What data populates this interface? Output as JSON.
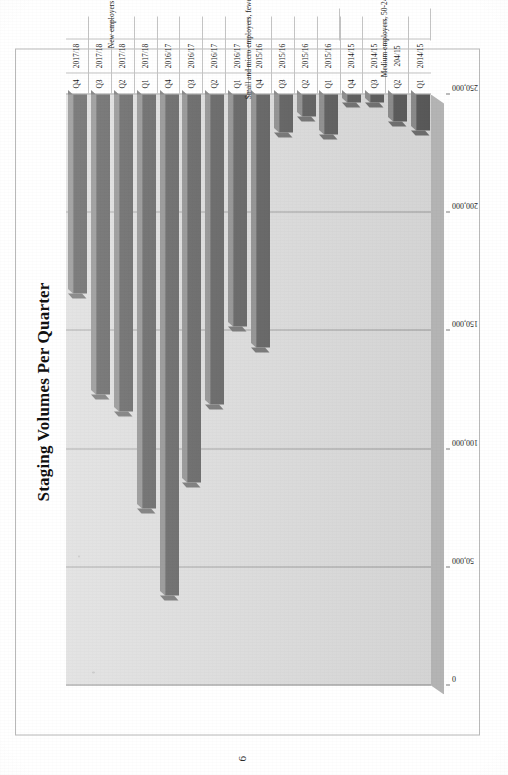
{
  "document": {
    "page_number": "6"
  },
  "chart": {
    "title": "Staging Volumes Per Quarter"
  },
  "chart_data": {
    "type": "bar",
    "orientation": "horizontal",
    "title": "Staging Volumes Per Quarter",
    "xlabel": "",
    "ylabel": "",
    "xlim": [
      0,
      250000
    ],
    "grid": true,
    "legend": null,
    "value_ticks": [
      "0",
      "50,000",
      "100,000",
      "150,000",
      "200,000",
      "250,000"
    ],
    "value_tick_numbers": [
      0,
      50000,
      100000,
      150000,
      200000,
      250000
    ],
    "categories": [
      {
        "quarter": "Q1",
        "year": "2014/15",
        "group": "Medium employers, 50-249 people"
      },
      {
        "quarter": "Q2",
        "year": "204/15",
        "group": "Medium employers, 50-249 people"
      },
      {
        "quarter": "Q3",
        "year": "2014/15",
        "group": "Medium employers, 50-249 people"
      },
      {
        "quarter": "Q4",
        "year": "2014/15",
        "group": "Medium employers, 50-249 people"
      },
      {
        "quarter": "Q1",
        "year": "2015/16",
        "group": "Small and micro employers, fewer than 50 people"
      },
      {
        "quarter": "Q2",
        "year": "2015/16",
        "group": "Small and micro employers, fewer than 50 people"
      },
      {
        "quarter": "Q3",
        "year": "2015/16",
        "group": "Small and micro employers, fewer than 50 people"
      },
      {
        "quarter": "Q4",
        "year": "2015/16",
        "group": "Small and micro employers, fewer than 50 people"
      },
      {
        "quarter": "Q1",
        "year": "2016/17",
        "group": "Small and micro employers, fewer than 50 people"
      },
      {
        "quarter": "Q2",
        "year": "2016/17",
        "group": "Small and micro employers, fewer than 50 people"
      },
      {
        "quarter": "Q3",
        "year": "2016/17",
        "group": "Small and micro employers, fewer than 50 people"
      },
      {
        "quarter": "Q4",
        "year": "2016/17",
        "group": "Small and micro employers, fewer than 50 people"
      },
      {
        "quarter": "Q1",
        "year": "2017/18",
        "group": "New employers"
      },
      {
        "quarter": "Q2",
        "year": "2017/18",
        "group": "New employers"
      },
      {
        "quarter": "Q3",
        "year": "2017/18",
        "group": "New employers"
      },
      {
        "quarter": "Q4",
        "year": "2017/18",
        "group": "New employers"
      }
    ],
    "values": [
      15400,
      11400,
      3400,
      3400,
      16800,
      9400,
      16100,
      107000,
      98000,
      131000,
      164000,
      212000,
      175000,
      134000,
      127000,
      84000
    ],
    "groups": [
      {
        "label": "Medium employers, 50-249 people",
        "start_index": 0,
        "count": 4
      },
      {
        "label": "Small and micro employers, fewer than 50 people",
        "start_index": 4,
        "count": 8
      },
      {
        "label": "New employers",
        "start_index": 12,
        "count": 4
      }
    ],
    "bar_color": "#5b5b5b",
    "plot_background": "#dcdcdc",
    "gridline_color": "#9b9b9b"
  }
}
